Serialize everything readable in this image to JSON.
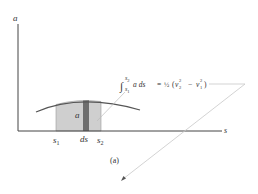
{
  "figure": {
    "caption": "(a)",
    "axes": {
      "y_label": "a",
      "x_label": "s"
    },
    "region": {
      "label": "a",
      "strip_label": "ds",
      "left_bound": "s",
      "left_bound_sub": "1",
      "right_bound": "s",
      "right_bound_sub": "2"
    },
    "equation": {
      "integral_upper": "s",
      "integral_upper_sub": "2",
      "integral_lower": "s",
      "integral_lower_sub": "1",
      "integrand": "a ds",
      "equals": "=",
      "fraction": "½",
      "open_paren": "(",
      "v2": "v",
      "v2_sub": "2",
      "v2_sup": "2",
      "minus": "−",
      "v1": "v",
      "v1_sub": "1",
      "v1_sup": "2",
      "close_paren": ")"
    },
    "colors": {
      "axis": "#444444",
      "curve": "#555555",
      "shade": "#cfcfcf",
      "strip": "#6e6e6e",
      "text": "#333333",
      "arrow_line": "#c8c8c8"
    }
  }
}
